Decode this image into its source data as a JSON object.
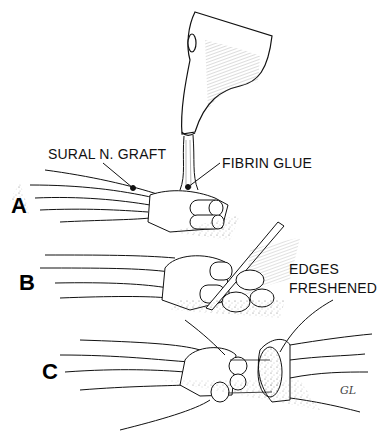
{
  "figure": {
    "panels": [
      {
        "letter": "A"
      },
      {
        "letter": "B"
      },
      {
        "letter": "C"
      }
    ],
    "labels": {
      "sural_graft": "SURAL N. GRAFT",
      "fibrin_glue": "FIBRIN GLUE",
      "edges_line1": "EDGES",
      "edges_line2": "FRESHENED"
    },
    "signature": "GL",
    "colors": {
      "ink": "#111111",
      "background": "#ffffff",
      "stipple": "#777777"
    }
  }
}
